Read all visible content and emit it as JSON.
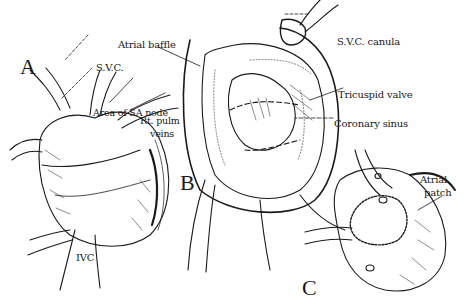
{
  "figure": {
    "panels": [
      {
        "id": "A",
        "label": "A"
      },
      {
        "id": "B",
        "label": "B"
      },
      {
        "id": "C",
        "label": "C"
      }
    ],
    "labels": {
      "svc": "S.V.C.",
      "area_sa_node": "Area of SA node",
      "rt_pulm_veins_1": "Rt. pulm",
      "rt_pulm_veins_2": "veins",
      "ivc": "IVC",
      "atrial_baffle": "Atrial baffle",
      "svc_canula": "S.V.C. canula",
      "tricuspid_valve": "Tricuspid valve",
      "coronary_sinus": "Coronary sinus",
      "atrial_patch_1": "Atrial",
      "atrial_patch_2": "patch"
    },
    "colors": {
      "ink": "#1a1a1a",
      "background": "#ffffff"
    }
  }
}
